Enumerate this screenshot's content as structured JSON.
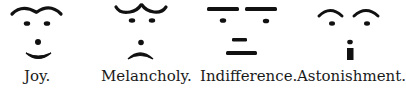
{
  "figure": {
    "ink_color": "#111111",
    "background": "#ffffff",
    "faces": [
      {
        "id": "joy",
        "label": "Joy.",
        "label_x": 24
      },
      {
        "id": "melancholy",
        "label": "Melancholy.",
        "label_x": 101
      },
      {
        "id": "indifference",
        "label": "Indifference.",
        "label_x": 200
      },
      {
        "id": "astonishment",
        "label": "Astonishment.",
        "label_x": 297
      }
    ]
  }
}
